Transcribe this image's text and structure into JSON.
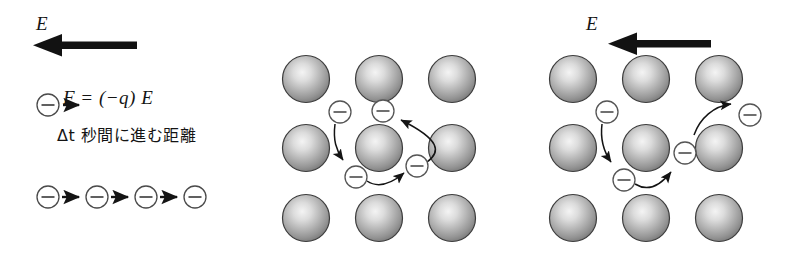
{
  "figure": {
    "background_color": "#ffffff",
    "width": 786,
    "height": 264
  },
  "colors": {
    "ink": "#141414",
    "sphere_outline": "#3a3a3a",
    "sphere_light": "#f2f2f2",
    "sphere_mid": "#a9a9a9",
    "sphere_dark": "#6f6f6f",
    "electron_outline": "#555555",
    "arrow_thin": "#1a1a1a",
    "arrow_thick": "#121212"
  },
  "panels": {
    "left": {
      "name": "force-and-drift-panel",
      "field_label": "E",
      "field_arrow_direction": "left",
      "formula": {
        "lhs": "F",
        "equals": "=",
        "rhs_open": "(",
        "rhs_sign": "−",
        "rhs_charge": "q",
        "rhs_close": ")",
        "rhs_field": "E",
        "full": "F = (−q) E"
      },
      "caption": {
        "delta_t": "Δt",
        "japanese": "秒間に進む距離",
        "full": "Δt 秒間に進む距離"
      },
      "single_electron": {
        "symbol": "−",
        "arrow_direction": "right"
      },
      "drift_chain": {
        "electron_symbol": "−",
        "count": 4,
        "arrow_count": 3,
        "arrow_direction": "right"
      }
    },
    "middle": {
      "name": "lattice-panel-scattering",
      "field_label": "",
      "lattice": {
        "rows": 3,
        "cols": 3,
        "ion_label": "metal-ion-sphere"
      },
      "electrons": [
        {
          "id": "e1",
          "symbol": "−"
        },
        {
          "id": "e2",
          "symbol": "−"
        },
        {
          "id": "e3",
          "symbol": "−"
        },
        {
          "id": "e4",
          "symbol": "−"
        }
      ],
      "paths": 3
    },
    "right": {
      "name": "lattice-panel-drift",
      "field_label": "E",
      "field_arrow_direction": "left",
      "lattice": {
        "rows": 3,
        "cols": 3,
        "ion_label": "metal-ion-sphere"
      },
      "electrons": [
        {
          "id": "e1",
          "symbol": "−"
        },
        {
          "id": "e2",
          "symbol": "−"
        },
        {
          "id": "e3",
          "symbol": "−"
        },
        {
          "id": "e4",
          "symbol": "−"
        }
      ],
      "paths": 3
    }
  }
}
